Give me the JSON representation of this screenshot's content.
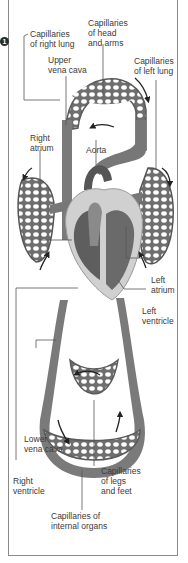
{
  "figure": {
    "badge": "1",
    "colors": {
      "vessel": "#6e6e6e",
      "vessel_dark": "#4a4a4a",
      "vessel_light": "#b0b0b0",
      "heart_light": "#cfcfcf",
      "frame": "#8a8a8a",
      "text": "#3a3a3a"
    }
  },
  "labels": {
    "cap_right_lung": "Capillaries\nof right lung",
    "cap_head_arms": "Capillaries\nof head\nand arms",
    "upper_vena_cava": "Upper\nvena cava",
    "cap_left_lung": "Capillaries\nof left lung",
    "right_atrium": "Right\natrium",
    "aorta": "Aorta",
    "left_atrium": "Left\natrium",
    "left_ventricle": "Left\nventricle",
    "lower_vena_cava": "Lower\nvena cava",
    "right_ventricle": "Right\nventricle",
    "cap_legs_feet": "Capillaries\nof legs\nand feet",
    "cap_internal_organs": "Capillaries of\ninternal organs"
  }
}
